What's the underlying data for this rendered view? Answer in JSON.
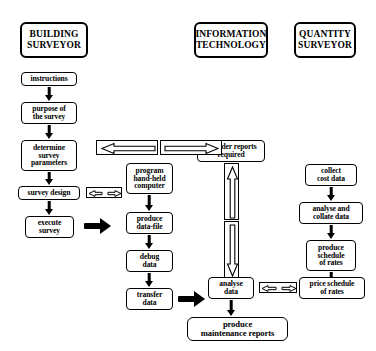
{
  "diagram": {
    "background_color": "#ffffff",
    "line_color": "#000000"
  },
  "columns": [
    {
      "id": "building-surveyor",
      "header": "BUILDING\nSURVEYOR",
      "header_line1": "BUILDING",
      "header_line2": "SURVEYOR"
    },
    {
      "id": "information-technology",
      "header": "INFORMATION\nTECHNOLOGY",
      "header_line1": "INFORMATION",
      "header_line2": "TECHNOLOGY"
    },
    {
      "id": "quantity-surveyor",
      "header": "QUANTITY\nSURVEYOR",
      "header_line1": "QUANTITY",
      "header_line2": "SURVEYOR"
    }
  ],
  "nodes": {
    "instructions": {
      "label": "instructions"
    },
    "purpose_of_survey": {
      "line1": "purpose of",
      "line2": "the survey"
    },
    "determine_survey_parameters": {
      "line1": "determine",
      "line2": "survey",
      "line3": "parameters"
    },
    "survey_design": {
      "label": "survey design"
    },
    "execute_survey": {
      "line1": "execute",
      "line2": "survey"
    },
    "program_hand_held_computer": {
      "line1": "program",
      "line2": "hand-held",
      "line3": "computer"
    },
    "produce_data_file": {
      "line1": "produce",
      "line2": "data-file"
    },
    "debug_data": {
      "line1": "debug",
      "line2": "data"
    },
    "transfer_data": {
      "line1": "transfer",
      "line2": "data"
    },
    "consider_reports_required": {
      "line1": "consider reports",
      "line2": "required"
    },
    "analyse_data": {
      "line1": "analyse",
      "line2": "data"
    },
    "produce_maintenance_reports": {
      "line1": "produce",
      "line2": "maintenance reports"
    },
    "collect_cost_data": {
      "line1": "collect",
      "line2": "cost data"
    },
    "analyse_and_collate_data": {
      "line1": "analyse and",
      "line2": "collate data"
    },
    "produce_schedule_of_rates": {
      "line1": "produce",
      "line2": "schedule",
      "line3": "of rates"
    },
    "price_schedule_of_rates": {
      "line1": "price schedule",
      "line2": "of rates"
    }
  },
  "connectors": {
    "down_arrows": "solid black down arrow",
    "block_arrows": "thick solid black right arrow",
    "outline_pair_top": "bidirectional outlined arrow pair (left and right)",
    "outline_vertical": "bidirectional outlined arrow pair (up and down)",
    "outline_small_survey_design": "small bidirectional outlined arrow",
    "outline_small_analyse_price": "small bidirectional outlined arrow"
  }
}
